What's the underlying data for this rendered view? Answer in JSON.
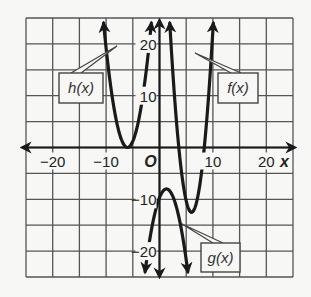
{
  "chart_data": {
    "type": "line",
    "title": "",
    "xlabel": "x",
    "ylabel": "",
    "xlim": [
      -25,
      25
    ],
    "ylim": [
      -25,
      25
    ],
    "grid": true,
    "grid_step": 5,
    "x_ticks": [
      {
        "value": -20,
        "label": "−20"
      },
      {
        "value": -10,
        "label": "−10"
      },
      {
        "value": 10,
        "label": "10"
      },
      {
        "value": 20,
        "label": "20"
      }
    ],
    "y_ticks": [
      {
        "value": 20,
        "label": "20"
      },
      {
        "value": 10,
        "label": "10"
      },
      {
        "value": -10,
        "label": "−10"
      },
      {
        "value": -20,
        "label": "−20"
      }
    ],
    "origin_label": "O",
    "series": [
      {
        "name": "h(x)",
        "form": "parabola",
        "a": 1.2,
        "h": -6,
        "k": 0,
        "opens": "up",
        "vertex": [
          -6,
          0
        ]
      },
      {
        "name": "f(x)",
        "form": "parabola",
        "a": 2.2,
        "h": 6,
        "k": -12.5,
        "opens": "up",
        "vertex": [
          6,
          -12.5
        ]
      },
      {
        "name": "g(x)",
        "form": "parabola",
        "a": -1.0,
        "h": 1.3,
        "k": -8,
        "opens": "down",
        "vertex": [
          1.3,
          -8
        ]
      }
    ],
    "annotations": [
      {
        "text": "h(x)",
        "target": "h(x)"
      },
      {
        "text": "f(x)",
        "target": "f(x)"
      },
      {
        "text": "g(x)",
        "target": "g(x)"
      }
    ]
  },
  "labels": {
    "x_axis": "x",
    "origin": "O",
    "h": "h(x)",
    "f": "f(x)",
    "g": "g(x)"
  },
  "colors": {
    "background": "#f7f7f5",
    "grid": "#555555",
    "curve": "#1a1a1a",
    "label_box": "#444444"
  }
}
